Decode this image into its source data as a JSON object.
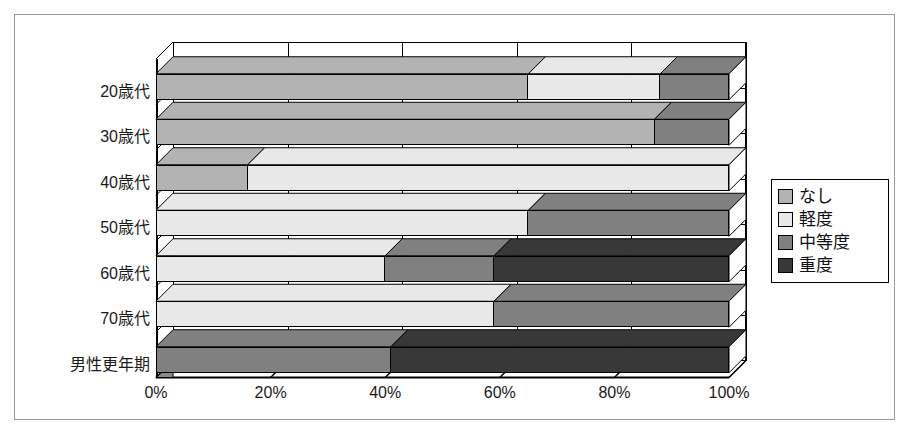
{
  "chart_data": {
    "type": "bar",
    "orientation": "horizontal",
    "stacked": "100%",
    "title": "",
    "xlabel": "",
    "ylabel": "",
    "xlim": [
      0,
      100
    ],
    "xticks": [
      "0%",
      "20%",
      "40%",
      "60%",
      "80%",
      "100%"
    ],
    "xtick_values": [
      0,
      20,
      40,
      60,
      80,
      100
    ],
    "grid": true,
    "legend_position": "right",
    "categories": [
      "20歳代",
      "30歳代",
      "40歳代",
      "50歳代",
      "60歳代",
      "70歳代",
      "男性更年期"
    ],
    "series": [
      {
        "name": "なし",
        "color": "#b3b3b3",
        "values": [
          65,
          87,
          16,
          0,
          0,
          0,
          0
        ]
      },
      {
        "name": "軽度",
        "color": "#e8e8e8",
        "values": [
          23,
          0,
          84,
          65,
          40,
          59,
          0
        ]
      },
      {
        "name": "中等度",
        "color": "#808080",
        "values": [
          12,
          13,
          0,
          35,
          19,
          41,
          41
        ]
      },
      {
        "name": "重度",
        "color": "#383838",
        "values": [
          0,
          0,
          0,
          0,
          41,
          0,
          59
        ]
      }
    ]
  },
  "legend": {
    "items": [
      {
        "label": "なし",
        "swatch": "#b3b3b3"
      },
      {
        "label": "軽度",
        "swatch": "#e8e8e8"
      },
      {
        "label": "中等度",
        "swatch": "#808080"
      },
      {
        "label": "重度",
        "swatch": "#383838"
      }
    ]
  },
  "axis": {
    "x_ticks": [
      "0%",
      "20%",
      "40%",
      "60%",
      "80%",
      "100%"
    ],
    "y_labels": [
      "20歳代",
      "30歳代",
      "40歳代",
      "50歳代",
      "60歳代",
      "70歳代",
      "男性更年期"
    ]
  },
  "colors": {
    "none": "#b3b3b3",
    "mild": "#e8e8e8",
    "moderate": "#808080",
    "severe": "#383838",
    "outline": "#000000",
    "frame": "#9a9a9a",
    "background": "#ffffff"
  }
}
